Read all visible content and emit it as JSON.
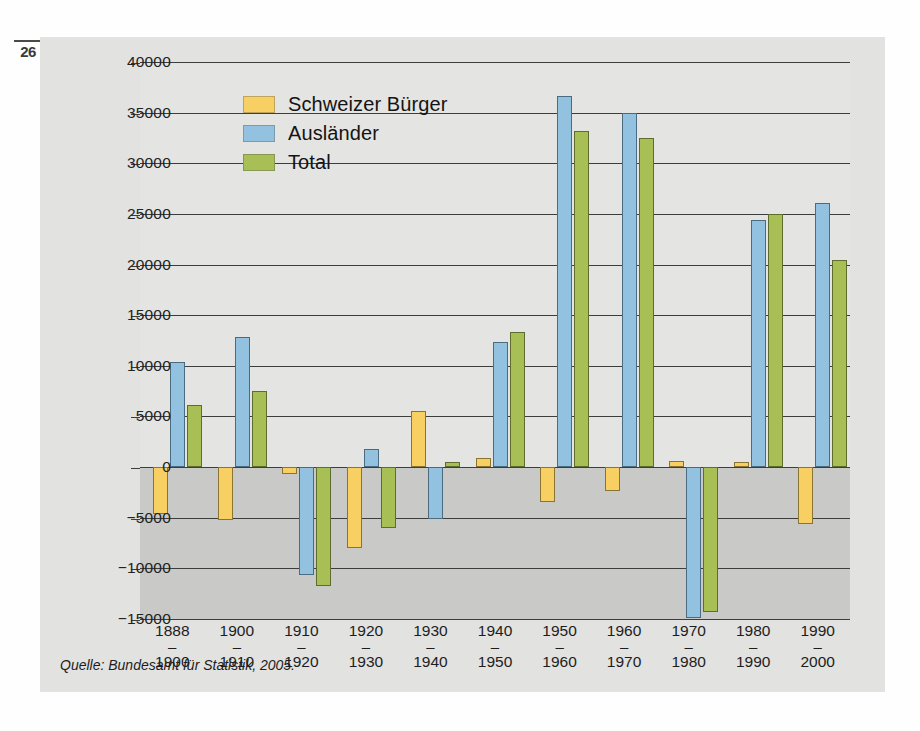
{
  "page": {
    "folio": "26"
  },
  "source_note": "Quelle: Bundesamt für Statistik, 2005.",
  "colors": {
    "series_schweizer": "#f8cf62",
    "series_auslaender": "#93c2e0",
    "series_total": "#a7bf54",
    "plot_positive_bg": "#e4e4e2",
    "plot_negative_bg": "#c9c9c7",
    "axis": "#3d3d3d"
  },
  "legend": {
    "position": "inside-top-left",
    "items": [
      {
        "label": "Schweizer Bürger",
        "color": "#f8cf62",
        "swatch_name": "legend-swatch-schweizer-buerger"
      },
      {
        "label": "Ausländer",
        "color": "#93c2e0",
        "swatch_name": "legend-swatch-auslaender"
      },
      {
        "label": "Total",
        "color": "#a7bf54",
        "swatch_name": "legend-swatch-total"
      }
    ]
  },
  "axis": {
    "y_ticks": [
      {
        "value": 40000,
        "label": "40000"
      },
      {
        "value": 35000,
        "label": "35000"
      },
      {
        "value": 30000,
        "label": "30000"
      },
      {
        "value": 25000,
        "label": "25000"
      },
      {
        "value": 20000,
        "label": "20000"
      },
      {
        "value": 15000,
        "label": "15000"
      },
      {
        "value": 10000,
        "label": "10000"
      },
      {
        "value": 5000,
        "label": "5000"
      },
      {
        "value": 0,
        "label": "0"
      },
      {
        "value": -5000,
        "label": "−5000"
      },
      {
        "value": -10000,
        "label": "−10000"
      },
      {
        "value": -15000,
        "label": "−15000"
      }
    ],
    "x_categories": [
      {
        "from": "1888",
        "dash": "–",
        "to": "1900"
      },
      {
        "from": "1900",
        "dash": "–",
        "to": "1910"
      },
      {
        "from": "1910",
        "dash": "–",
        "to": "1920"
      },
      {
        "from": "1920",
        "dash": "–",
        "to": "1930"
      },
      {
        "from": "1930",
        "dash": "–",
        "to": "1940"
      },
      {
        "from": "1940",
        "dash": "–",
        "to": "1950"
      },
      {
        "from": "1950",
        "dash": "–",
        "to": "1960"
      },
      {
        "from": "1960",
        "dash": "–",
        "to": "1970"
      },
      {
        "from": "1970",
        "dash": "–",
        "to": "1980"
      },
      {
        "from": "1980",
        "dash": "–",
        "to": "1990"
      },
      {
        "from": "1990",
        "dash": "–",
        "to": "2000"
      }
    ]
  },
  "chart_data": {
    "type": "bar",
    "title": "",
    "xlabel": "",
    "ylabel": "",
    "ylim": [
      -15000,
      40000
    ],
    "ytick_step": 5000,
    "grid": true,
    "legend_position": "inside-top-left",
    "categories": [
      "1888–1900",
      "1900–1910",
      "1910–1920",
      "1920–1930",
      "1930–1940",
      "1940–1950",
      "1950–1960",
      "1960–1970",
      "1970–1980",
      "1980–1990",
      "1990–2000"
    ],
    "series": [
      {
        "name": "Schweizer Bürger",
        "color": "#f8cf62",
        "values": [
          -4600,
          -5200,
          -700,
          -8000,
          5500,
          900,
          -3400,
          -2400,
          600,
          500,
          -5600
        ]
      },
      {
        "name": "Ausländer",
        "color": "#93c2e0",
        "values": [
          10400,
          12800,
          -10700,
          1800,
          -5100,
          12400,
          36600,
          35000,
          -14900,
          24400,
          26100
        ]
      },
      {
        "name": "Total",
        "color": "#a7bf54",
        "values": [
          6100,
          7500,
          -11700,
          -6000,
          500,
          13300,
          33200,
          32500,
          -14300,
          25000,
          20400
        ]
      }
    ]
  }
}
